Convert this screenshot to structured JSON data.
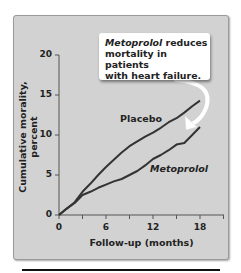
{
  "chart_data": {
    "type": "line",
    "title": "",
    "xlabel": "Follow-up (months)",
    "ylabel": "Cumulative morality, percent",
    "xlim": [
      0,
      21
    ],
    "ylim": [
      0,
      20
    ],
    "x_ticks": [
      0,
      6,
      12,
      18
    ],
    "x_minor_ticks_every": 3,
    "y_ticks": [
      0,
      5,
      10,
      15,
      20
    ],
    "grid": false,
    "legend": "inline labels",
    "x": [
      0,
      1,
      2,
      3,
      4,
      5,
      6,
      7,
      8,
      9,
      10,
      11,
      12,
      13,
      14,
      15,
      16,
      17,
      18
    ],
    "series": [
      {
        "name": "Placebo",
        "values": [
          0,
          0.8,
          1.6,
          2.9,
          3.9,
          5.0,
          6.0,
          6.9,
          7.8,
          8.6,
          9.2,
          9.8,
          10.3,
          10.9,
          11.6,
          12.1,
          12.8,
          13.6,
          14.3
        ]
      },
      {
        "name": "Metoprolol",
        "values": [
          0,
          0.8,
          1.5,
          2.5,
          2.9,
          3.4,
          3.8,
          4.2,
          4.5,
          5.0,
          5.5,
          6.2,
          7.0,
          7.5,
          8.1,
          8.8,
          9.0,
          10.0,
          11.0
        ]
      }
    ],
    "annotations": [
      {
        "text": "Metoprolol reduces mortality in patients with heart failure.",
        "arrow_to": {
          "x": 17.5,
          "y": 10.8
        }
      }
    ]
  },
  "callout": {
    "italic": "Metoprolol",
    "line1_rest": " reduces",
    "line2": "mortality in patients",
    "line3": "with heart failure."
  },
  "axes": {
    "ylabel": "Cumulative morality, percent",
    "xlabel": "Follow-up (months)",
    "y_ticks": [
      "20",
      "15",
      "10",
      "5",
      "0"
    ],
    "x_ticks": [
      "0",
      "6",
      "12",
      "18"
    ]
  },
  "labels": {
    "placebo": "Placebo",
    "metoprolol": "Metoprolol"
  },
  "colors": {
    "panel": "#d2d2d2",
    "line": "#333333",
    "callout_bg": "#ffffff"
  }
}
